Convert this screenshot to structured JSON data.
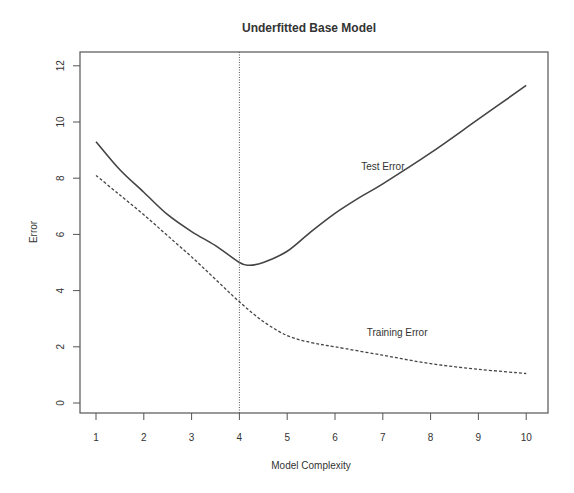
{
  "chart_data": {
    "type": "line",
    "title": "Underfitted Base Model",
    "xlabel": "Model Complexity",
    "ylabel": "Error",
    "xlim": [
      0.7,
      10.4
    ],
    "ylim": [
      -0.35,
      12.5
    ],
    "xticks": [
      1,
      2,
      3,
      4,
      5,
      6,
      7,
      8,
      9,
      10
    ],
    "yticks": [
      0,
      2,
      4,
      6,
      8,
      10,
      12
    ],
    "grid": false,
    "legend": "none (inline annotations)",
    "vline": {
      "x": 4,
      "style": "dotted"
    },
    "series": [
      {
        "name": "Test Error",
        "style": "solid",
        "x": [
          1,
          1.5,
          2,
          2.5,
          3,
          3.5,
          4,
          4.2,
          4.5,
          5,
          5.5,
          6,
          6.5,
          7,
          8,
          9,
          10
        ],
        "values": [
          9.3,
          8.3,
          7.5,
          6.7,
          6.1,
          5.6,
          5.0,
          4.9,
          5.0,
          5.4,
          6.1,
          6.75,
          7.3,
          7.8,
          8.9,
          10.1,
          11.3
        ]
      },
      {
        "name": "Training Error",
        "style": "dashed",
        "x": [
          1,
          1.5,
          2,
          2.5,
          3,
          3.5,
          4,
          4.5,
          5,
          5.5,
          6,
          7,
          8,
          9,
          10
        ],
        "values": [
          8.1,
          7.4,
          6.7,
          5.95,
          5.2,
          4.4,
          3.6,
          2.9,
          2.4,
          2.15,
          2.0,
          1.7,
          1.4,
          1.2,
          1.05
        ]
      }
    ],
    "annotations": [
      {
        "text": "Test Error",
        "x": 7.0,
        "y": 8.3
      },
      {
        "text": "Training Error",
        "x": 7.3,
        "y": 2.4
      }
    ]
  }
}
